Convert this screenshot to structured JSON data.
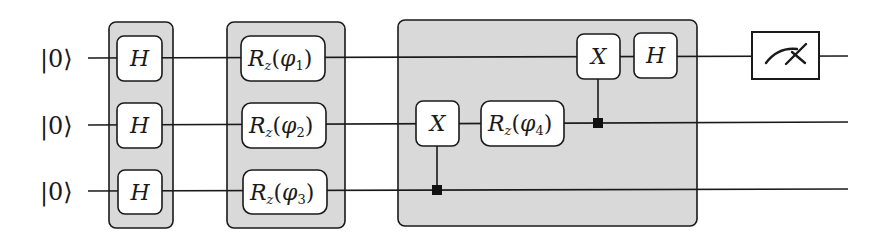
{
  "diagram": {
    "type": "quantum-circuit",
    "qubits": [
      {
        "id": 0,
        "initial_state": "|0⟩"
      },
      {
        "id": 1,
        "initial_state": "|0⟩"
      },
      {
        "id": 2,
        "initial_state": "|0⟩"
      }
    ],
    "groups": [
      {
        "name": "hadamard-layer",
        "gates": [
          "H",
          "H",
          "H"
        ]
      },
      {
        "name": "rz-layer",
        "gates": [
          "Rz(φ1)",
          "Rz(φ2)",
          "Rz(φ3)"
        ]
      },
      {
        "name": "entangling-block",
        "gates": [
          "CNOT(2→1)",
          "Rz(φ4) on q1",
          "CNOT(1→0)",
          "H on q0"
        ]
      }
    ],
    "gates": {
      "h1": {
        "label": "H"
      },
      "h2": {
        "label": "H"
      },
      "h3": {
        "label": "H"
      },
      "rz1": {
        "name": "R",
        "sub": "z",
        "open": "(",
        "param": "φ",
        "index": "1",
        "close": ")"
      },
      "rz2": {
        "name": "R",
        "sub": "z",
        "open": "(",
        "param": "φ",
        "index": "2",
        "close": ")"
      },
      "rz3": {
        "name": "R",
        "sub": "z",
        "open": "(",
        "param": "φ",
        "index": "3",
        "close": ")"
      },
      "x_mid": {
        "label": "X"
      },
      "rz4": {
        "name": "R",
        "sub": "z",
        "open": "(",
        "param": "φ",
        "index": "4",
        "close": ")"
      },
      "x_top": {
        "label": "X"
      },
      "h_top": {
        "label": "H"
      }
    },
    "measurement": {
      "qubit": 0,
      "icon": "meter-icon"
    },
    "colors": {
      "wire": "#1a1a1a",
      "group_fill": "#d9d9d9",
      "gate_fill": "#ffffff",
      "control_dot": "#111111"
    }
  }
}
